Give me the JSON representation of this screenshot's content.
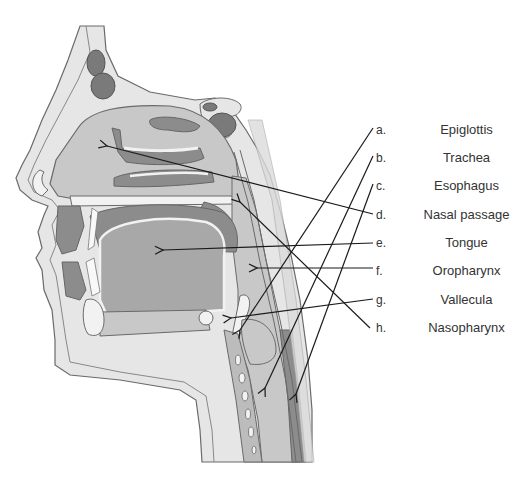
{
  "diagram": {
    "labels": [
      {
        "letter": "a.",
        "term": "Epiglottis",
        "y": 121
      },
      {
        "letter": "b.",
        "term": "Trachea",
        "y": 149
      },
      {
        "letter": "c.",
        "term": "Esophagus",
        "y": 177
      },
      {
        "letter": "d.",
        "term": "Nasal passage",
        "y": 206
      },
      {
        "letter": "e.",
        "term": "Tongue",
        "y": 234
      },
      {
        "letter": "f.",
        "term": "Oropharynx",
        "y": 262
      },
      {
        "letter": "g.",
        "term": "Vallecula",
        "y": 291
      },
      {
        "letter": "h.",
        "term": "Nasopharynx",
        "y": 319
      }
    ],
    "leader_lines": [
      {
        "from_label": "a.",
        "start": [
          373,
          128
        ],
        "end": [
          240,
          330
        ],
        "arrow": true
      },
      {
        "from_label": "b.",
        "start": [
          373,
          156
        ],
        "end": [
          265,
          388
        ],
        "arrow": true
      },
      {
        "from_label": "c.",
        "start": [
          373,
          184
        ],
        "end": [
          296,
          394
        ],
        "arrow": true
      },
      {
        "from_label": "d.",
        "start": [
          373,
          214
        ],
        "end": [
          107,
          146
        ],
        "arrow": true
      },
      {
        "from_label": "e.",
        "start": [
          373,
          243
        ],
        "end": [
          163,
          250
        ],
        "arrow": true
      },
      {
        "from_label": "f.",
        "start": [
          373,
          268
        ],
        "end": [
          257,
          268
        ],
        "arrow": true
      },
      {
        "from_label": "g.",
        "start": [
          373,
          299
        ],
        "end": [
          231,
          318
        ],
        "arrow": true
      },
      {
        "from_label": "h.",
        "start": [
          370,
          328
        ],
        "end": [
          240,
          202
        ],
        "arrow": true
      }
    ],
    "colors": {
      "background": "#ffffff",
      "skin": "#e6e6e6",
      "outline": "#6a6a6a",
      "cavity": "#c8c8c8",
      "tongue": "#a8a8a8",
      "muscle_dark": "#8c8c8c",
      "bone_light": "#f2f2f2",
      "sinus_dark": "#7a7a7a",
      "line": "#1a1a1a",
      "text": "#333333"
    }
  }
}
